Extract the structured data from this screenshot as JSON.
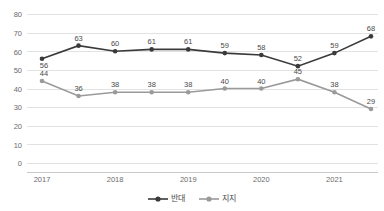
{
  "chart_data": {
    "type": "line",
    "title": "",
    "xlabel": "",
    "ylabel": "",
    "ylim": [
      0,
      80
    ],
    "ytick_step": 10,
    "yticks": [
      "80",
      "70",
      "60",
      "50",
      "40",
      "30",
      "20",
      "10",
      "0"
    ],
    "categories": [
      "2017",
      "",
      "2018",
      "",
      "2019",
      "",
      "2020",
      "",
      "2021",
      ""
    ],
    "xtick_labels": [
      "2017",
      "2018",
      "2019",
      "2020",
      "2021"
    ],
    "grid": true,
    "legend_position": "bottom",
    "series": [
      {
        "name": "반대",
        "color": "#3a3a3a",
        "marker": "circle",
        "values": [
          56,
          63,
          60,
          61,
          61,
          59,
          58,
          52,
          59,
          68
        ],
        "labels": [
          "56",
          "63",
          "60",
          "61",
          "61",
          "59",
          "58",
          "52",
          "59",
          "68"
        ]
      },
      {
        "name": "지지",
        "color": "#9a9a9a",
        "marker": "circle",
        "values": [
          44,
          36,
          38,
          38,
          38,
          40,
          40,
          45,
          38,
          29
        ],
        "labels": [
          "44",
          "36",
          "38",
          "38",
          "38",
          "40",
          "40",
          "45",
          "38",
          "29"
        ]
      }
    ]
  },
  "legend": {
    "items": [
      {
        "label": "반대",
        "color": "#3a3a3a"
      },
      {
        "label": "지지",
        "color": "#9a9a9a"
      }
    ]
  }
}
